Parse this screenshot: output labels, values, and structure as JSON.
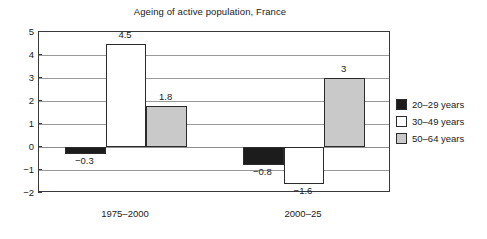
{
  "chart_data": {
    "type": "bar",
    "title": "Ageing of active population, France",
    "xlabel": "",
    "ylabel": "",
    "categories": [
      "1975–2000",
      "2000–25"
    ],
    "series": [
      {
        "name": "20–29 years",
        "color": "#1c1c1c",
        "values": [
          -0.3,
          -0.8
        ],
        "labels": [
          "−0.3",
          "−0.8"
        ]
      },
      {
        "name": "30–49 years",
        "color": "#ffffff",
        "values": [
          4.5,
          -1.6
        ],
        "labels": [
          "4.5",
          "−1.6"
        ]
      },
      {
        "name": "50–64 years",
        "color": "#c9c9c9",
        "values": [
          1.8,
          3
        ],
        "labels": [
          "1.8",
          "3"
        ]
      }
    ],
    "ylim": [
      -2,
      5
    ],
    "yticks": [
      5,
      4,
      3,
      2,
      1,
      0,
      -1,
      -2
    ],
    "ytick_labels": [
      "5",
      "4",
      "3",
      "2",
      "1",
      "0",
      "−1",
      "−2"
    ],
    "grid": true,
    "legend_position": "right"
  },
  "legend": {
    "items": [
      {
        "label": "20–29 years",
        "swatch": "legend-swatch-black"
      },
      {
        "label": "30–49 years",
        "swatch": "legend-swatch-white"
      },
      {
        "label": "50–64 years",
        "swatch": "legend-swatch-grey"
      }
    ]
  }
}
